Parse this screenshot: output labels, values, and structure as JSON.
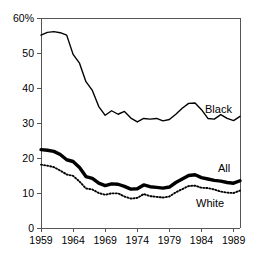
{
  "chart_data": {
    "type": "line",
    "title": "",
    "subtitle": "",
    "xlabel": "",
    "ylabel": "",
    "xlim": [
      1959,
      1990
    ],
    "ylim": [
      0,
      60
    ],
    "grid": false,
    "legend_position": "inline-right",
    "y_ticks": [
      "0",
      "10",
      "20",
      "30",
      "40",
      "50",
      "60%"
    ],
    "y_tick_values": [
      0,
      10,
      20,
      30,
      40,
      50,
      60
    ],
    "x_ticks": [
      "1959",
      "1964",
      "1969",
      "1974",
      "1979",
      "1984",
      "1989"
    ],
    "x_tick_values": [
      1959,
      1964,
      1969,
      1974,
      1979,
      1984,
      1989
    ],
    "x": [
      1959,
      1960,
      1961,
      1962,
      1963,
      1964,
      1965,
      1966,
      1967,
      1968,
      1969,
      1970,
      1971,
      1972,
      1973,
      1974,
      1975,
      1976,
      1977,
      1978,
      1979,
      1980,
      1981,
      1982,
      1983,
      1984,
      1985,
      1986,
      1987,
      1988,
      1989,
      1990
    ],
    "series": [
      {
        "name": "Black",
        "style": "thin-solid",
        "color": "#000000",
        "label": "Black",
        "values": [
          55.1,
          55.9,
          56.1,
          55.8,
          55.1,
          49.6,
          47.1,
          41.8,
          39.3,
          34.7,
          32.2,
          33.5,
          32.5,
          33.3,
          31.4,
          30.3,
          31.3,
          31.1,
          31.3,
          30.6,
          31.0,
          32.5,
          34.2,
          35.6,
          35.7,
          33.8,
          31.3,
          31.1,
          32.4,
          31.3,
          30.7,
          31.9
        ]
      },
      {
        "name": "All",
        "style": "thick-solid",
        "color": "#000000",
        "label": "All",
        "values": [
          22.4,
          22.2,
          21.9,
          21.0,
          19.5,
          19.0,
          17.3,
          14.7,
          14.2,
          12.8,
          12.1,
          12.6,
          12.5,
          11.9,
          11.1,
          11.2,
          12.3,
          11.8,
          11.6,
          11.4,
          11.7,
          13.0,
          14.0,
          15.0,
          15.2,
          14.4,
          14.0,
          13.6,
          13.4,
          13.0,
          12.8,
          13.5
        ]
      },
      {
        "name": "White",
        "style": "dotted",
        "color": "#000000",
        "label": "White",
        "values": [
          18.1,
          17.8,
          17.4,
          16.4,
          15.3,
          14.9,
          13.3,
          11.3,
          11.0,
          10.0,
          9.5,
          9.9,
          9.9,
          9.0,
          8.4,
          8.6,
          9.7,
          9.1,
          8.9,
          8.7,
          9.0,
          10.2,
          11.1,
          12.0,
          12.1,
          11.5,
          11.4,
          11.0,
          10.4,
          10.1,
          10.0,
          10.7
        ]
      }
    ]
  },
  "geometry": {
    "plot_left": 41,
    "plot_right": 240,
    "plot_top": 18,
    "plot_bottom": 228
  }
}
